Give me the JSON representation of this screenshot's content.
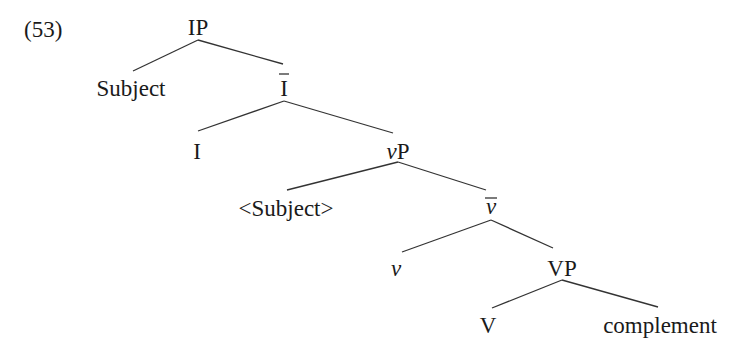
{
  "example_number": "(53)",
  "tree": {
    "nodes": {
      "ip": "IP",
      "subject": "Subject",
      "i_bar": "I",
      "i_head": "I",
      "vp_little_v": "P",
      "vp_little_v_prefix": "v",
      "subject_trace": "<Subject>",
      "v_bar": "v",
      "v_head": "v",
      "vp": "VP",
      "v": "V",
      "complement": "complement"
    },
    "edges": [
      [
        "IP",
        "Subject"
      ],
      [
        "IP",
        "Ī"
      ],
      [
        "Ī",
        "I"
      ],
      [
        "Ī",
        "vP"
      ],
      [
        "vP",
        "<Subject>"
      ],
      [
        "vP",
        "v̄"
      ],
      [
        "v̄",
        "v"
      ],
      [
        "v̄",
        "VP"
      ],
      [
        "VP",
        "V"
      ],
      [
        "VP",
        "complement"
      ]
    ]
  }
}
